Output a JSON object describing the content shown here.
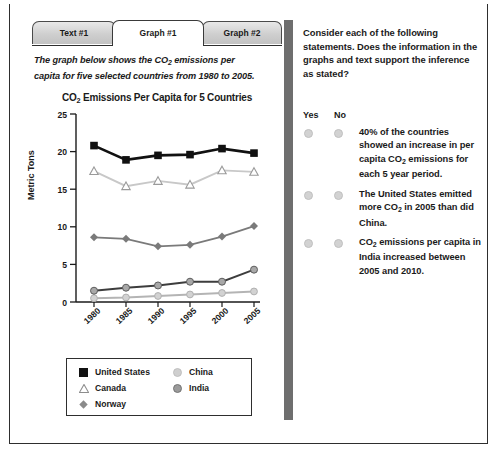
{
  "tabs": [
    {
      "label": "Text #1",
      "active": false
    },
    {
      "label": "Graph #1",
      "active": true
    },
    {
      "label": "Graph #2",
      "active": false
    }
  ],
  "intro": {
    "line1": "The graph below shows the CO",
    "sub1": "2",
    "line1b": " emissions per",
    "line2": "capita for five selected countries from 1980 to 2005."
  },
  "chart_data": {
    "type": "line",
    "title_pre": "CO",
    "title_sub": "2",
    "title_post": " Emissions Per Capita for 5 Countries",
    "title": "CO2 Emissions Per Capita for 5 Countries",
    "xlabel": "",
    "ylabel": "Metric Tons",
    "categories": [
      "1980",
      "1985",
      "1990",
      "1995",
      "2000",
      "2005"
    ],
    "x": [
      1980,
      1985,
      1990,
      1995,
      2000,
      2005
    ],
    "ylim": [
      0,
      25
    ],
    "yticks": [
      0,
      5,
      10,
      15,
      20,
      25
    ],
    "grid": false,
    "legend_position": "below-plot",
    "series": [
      {
        "name": "United States",
        "marker": "filled-square",
        "color": "#111111",
        "values": [
          20.8,
          18.9,
          19.5,
          19.6,
          20.4,
          19.8
        ]
      },
      {
        "name": "Canada",
        "marker": "open-triangle",
        "color": "#c8c8c8",
        "values": [
          17.4,
          15.4,
          16.1,
          15.6,
          17.5,
          17.3
        ]
      },
      {
        "name": "Norway",
        "marker": "filled-diamond",
        "color": "#7a7a7a",
        "values": [
          8.6,
          8.4,
          7.4,
          7.6,
          8.7,
          10.1
        ]
      },
      {
        "name": "India",
        "marker": "filled-circle-gray",
        "color": "#3d3d3d",
        "values": [
          1.5,
          1.9,
          2.2,
          2.7,
          2.7,
          4.3
        ]
      },
      {
        "name": "China",
        "marker": "filled-circle-light",
        "color": "#b4b4b4",
        "values": [
          0.5,
          0.6,
          0.8,
          1.0,
          1.2,
          1.4
        ]
      }
    ]
  },
  "legend": [
    {
      "label": "United States",
      "marker": "filled-square"
    },
    {
      "label": "Canada",
      "marker": "open-triangle"
    },
    {
      "label": "Norway",
      "marker": "filled-diamond"
    },
    {
      "label": "China",
      "marker": "filled-circle-light"
    },
    {
      "label": "India",
      "marker": "filled-circle-gray"
    }
  ],
  "question": {
    "instruction": "Consider each of the following statements. Does the information in the graphs and text support the inference as stated?",
    "yes_label": "Yes",
    "no_label": "No",
    "statements": [
      {
        "parts": [
          "40% of the countries showed an increase in per capita CO",
          "2",
          " emissions for each 5 year period."
        ],
        "text": "40% of the countries showed an increase in per capita CO2 emissions for each 5 year period."
      },
      {
        "parts": [
          "The United States emitted more CO",
          "2",
          " in 2005 than did China."
        ],
        "text": "The United States emitted more CO2 in 2005 than did China."
      },
      {
        "parts": [
          "CO",
          "2",
          " emissions per capita in India increased between 2005 and 2010."
        ],
        "text": "CO2 emissions per capita in India increased between 2005 and 2010."
      }
    ]
  },
  "colors": {
    "divider": "#6e6e6e",
    "border": "#2e2e2e",
    "tab_inactive": "#cfcfcf",
    "tab_active": "#ffffff"
  }
}
